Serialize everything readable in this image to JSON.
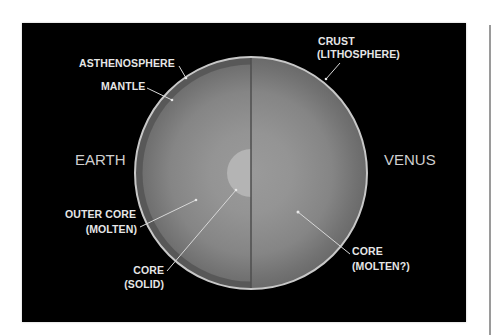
{
  "diagram": {
    "planets": {
      "left": {
        "name": "EARTH"
      },
      "right": {
        "name": "VENUS"
      }
    },
    "labels": {
      "asthenosphere": "ASTHENOSPHERE",
      "mantle": "MANTLE",
      "outer_core_line1": "OUTER CORE",
      "outer_core_line2": "(MOLTEN)",
      "core_solid_line1": "CORE",
      "core_solid_line2": "(SOLID)",
      "crust_line1": "CRUST",
      "crust_line2": "(LITHOSPHERE)",
      "core_molten_line1": "CORE",
      "core_molten_line2": "(MOLTEN?)"
    },
    "colors": {
      "background": "#000000",
      "crust_outline": "#c8c8c8",
      "mantle_outer": "#6a6a6a",
      "mantle_inner": "#929292",
      "asthenosphere_band": "#555555",
      "inner_core": "#b4b4b4",
      "divider": "#4e4e4e",
      "label_text": "#e6e6e6"
    }
  }
}
